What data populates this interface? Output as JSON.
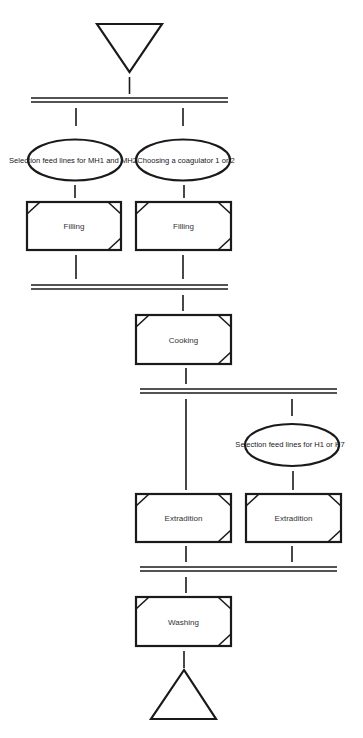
{
  "diagram": {
    "type": "process-flow (SFC / GRAFCET-style)",
    "colors": {
      "stroke": "#1a1a1a",
      "background": "#ffffff",
      "text": "#333333"
    },
    "start": {
      "symbol": "inverted-triangle"
    },
    "end": {
      "symbol": "triangle"
    },
    "stage1": {
      "branches": [
        {
          "decision": "Selection feed lines for MH1 and MH2",
          "step": "Filling"
        },
        {
          "decision": "Choosing a coagulator 1 or 2",
          "step": "Filling"
        }
      ]
    },
    "stage2": {
      "step": "Cooking"
    },
    "stage3": {
      "branches": [
        {
          "decision": "",
          "step": "Extradition"
        },
        {
          "decision": "Selection feed lines for H1 or H7",
          "step": "Extradition"
        }
      ]
    },
    "stage4": {
      "step": "Washing"
    }
  },
  "labels": {
    "ellipse_mh": "Selection feed lines for MH1 and MH2",
    "ellipse_coag": "Choosing a coagulator 1 or 2",
    "ellipse_h": "Selection feed lines for H1 or H7",
    "filling_1": "Filling",
    "filling_2": "Filling",
    "cooking": "Cooking",
    "extradition_1": "Extradition",
    "extradition_2": "Extradition",
    "washing": "Washing"
  }
}
